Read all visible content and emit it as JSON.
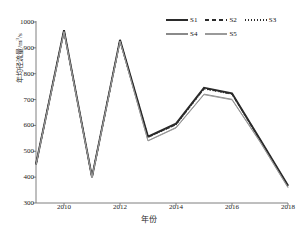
{
  "chart_data": {
    "type": "line",
    "title": "",
    "xlabel": "年份",
    "ylabel": "年均径流量/m³/s",
    "xlim": [
      2009,
      2018
    ],
    "ylim": [
      300,
      1000
    ],
    "ytick_step": 100,
    "grid": false,
    "legend_position": "top-right",
    "x": [
      2009,
      2010,
      2011,
      2012,
      2013,
      2014,
      2015,
      2016,
      2017,
      2018
    ],
    "xticks": [
      "2010",
      "2012",
      "2014",
      "2016",
      "2018"
    ],
    "xtick_values": [
      2010,
      2012,
      2014,
      2016,
      2018
    ],
    "yticks": [
      "300",
      "400",
      "500",
      "600",
      "700",
      "800",
      "900",
      "1000"
    ],
    "ytick_values": [
      300,
      400,
      500,
      600,
      700,
      800,
      900,
      1000
    ],
    "series": [
      {
        "name": "S1",
        "style": "solid",
        "width": 1.9,
        "color": "#2b2b2b",
        "values": [
          450,
          968,
          400,
          931,
          557,
          607,
          746,
          724,
          547,
          368
        ]
      },
      {
        "name": "S2",
        "style": "dashed",
        "width": 1.4,
        "color": "#2b2b2b",
        "values": [
          449,
          966,
          399,
          929,
          555,
          604,
          743,
          722,
          545,
          366
        ]
      },
      {
        "name": "S3",
        "style": "dotted",
        "width": 1.2,
        "color": "#2b2b2b",
        "values": [
          449,
          965,
          399,
          928,
          554,
          603,
          741,
          721,
          544,
          365
        ]
      },
      {
        "name": "S4",
        "style": "solid",
        "width": 1.0,
        "color": "#8a8a8a",
        "values": [
          448,
          963,
          398,
          926,
          541,
          592,
          721,
          701,
          538,
          361
        ]
      },
      {
        "name": "S5",
        "style": "solid",
        "width": 1.0,
        "color": "#9a9a9a",
        "values": [
          448,
          962,
          398,
          925,
          540,
          590,
          719,
          699,
          536,
          359
        ]
      }
    ]
  },
  "legend": {
    "rows": [
      [
        {
          "label": "S1",
          "style": "solid",
          "color": "#2b2b2b",
          "width": 2
        },
        {
          "label": "S2",
          "style": "dashed",
          "color": "#2b2b2b",
          "width": 1.6
        },
        {
          "label": "S3",
          "style": "dotted",
          "color": "#2b2b2b",
          "width": 1.4
        }
      ],
      [
        {
          "label": "S4",
          "style": "solid",
          "color": "#8a8a8a",
          "width": 1.2
        },
        {
          "label": "S5",
          "style": "solid",
          "color": "#9a9a9a",
          "width": 1.2
        }
      ]
    ]
  },
  "axis": {
    "color": "#6f6f6f"
  }
}
